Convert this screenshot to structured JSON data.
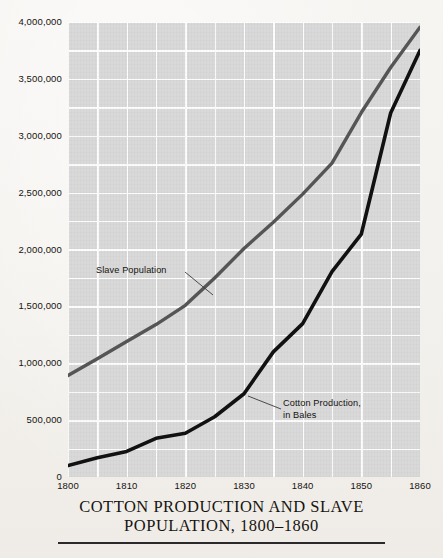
{
  "figure": {
    "title_line_1": "COTTON PRODUCTION AND SLAVE",
    "title_line_2": "POPULATION, 1800–1860"
  },
  "annotations": {
    "slave": "Slave Population",
    "cotton_line_1": "Cotton Production,",
    "cotton_line_2": "in Bales"
  },
  "colors": {
    "paper": "#f6f4f1",
    "plot_background": "#d9d9d9",
    "gridline": "#ffffff",
    "slave_line": "#555555",
    "cotton_line": "#111111",
    "text": "#15130f"
  },
  "chart_data": {
    "type": "line",
    "title": "COTTON PRODUCTION AND SLAVE POPULATION, 1800–1860",
    "xlabel": "",
    "ylabel": "",
    "xlim": [
      1800,
      1860
    ],
    "ylim": [
      0,
      4000000
    ],
    "grid": true,
    "x_major_ticks": [
      1800,
      1810,
      1820,
      1830,
      1840,
      1850,
      1860
    ],
    "x_tick_labels": [
      "1800",
      "1810",
      "1820",
      "1830",
      "1840",
      "1850",
      "1860"
    ],
    "x_minor_gridline_step": 5,
    "y_major_ticks": [
      0,
      500000,
      1000000,
      1500000,
      2000000,
      2500000,
      3000000,
      3500000,
      4000000
    ],
    "y_tick_labels": [
      "0",
      "500,000",
      "1,000,000",
      "1,500,000",
      "2,000,000",
      "2,500,000",
      "3,000,000",
      "3,500,000",
      "4,000,000"
    ],
    "y_minor_gridline_step": 250000,
    "legend_position": "inline-annotation",
    "series": [
      {
        "name": "Slave Population",
        "color": "#555555",
        "width": 3.4,
        "x": [
          1800,
          1805,
          1810,
          1815,
          1820,
          1825,
          1830,
          1835,
          1840,
          1845,
          1850,
          1855,
          1860
        ],
        "values": [
          893000,
          1040000,
          1191000,
          1340000,
          1509000,
          1750000,
          2009000,
          2240000,
          2487000,
          2760000,
          3204000,
          3600000,
          3954000
        ]
      },
      {
        "name": "Cotton Production, in Bales",
        "color": "#111111",
        "width": 3.6,
        "x": [
          1800,
          1805,
          1810,
          1815,
          1820,
          1825,
          1830,
          1835,
          1840,
          1845,
          1850,
          1855,
          1860
        ],
        "values": [
          100000,
          170000,
          225000,
          340000,
          385000,
          530000,
          732000,
          1100000,
          1348000,
          1805000,
          2136000,
          3200000,
          3750000
        ]
      }
    ]
  }
}
